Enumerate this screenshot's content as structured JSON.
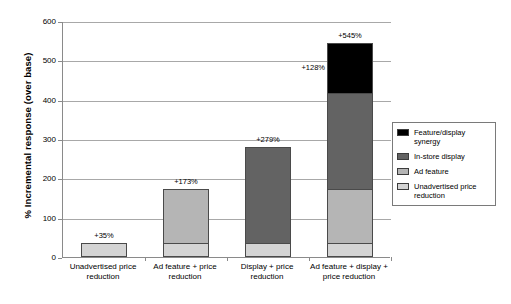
{
  "chart_data": {
    "type": "bar",
    "subtype": "stacked-bar",
    "title": "",
    "xlabel": "",
    "ylabel": "% Incremental response (over base)",
    "ylim": [
      0,
      600
    ],
    "ytick_values": [
      0,
      100,
      200,
      300,
      400,
      500,
      600
    ],
    "ytick_labels": [
      "0",
      "100",
      "200",
      "300",
      "400",
      "500",
      "600"
    ],
    "grid": true,
    "legend_position": "inside-bottom-right",
    "categories": [
      "Unadvertised price reduction",
      "Ad feature + price reduction",
      "Display + price reduction",
      "Ad feature + display + price reduction"
    ],
    "series": [
      {
        "name": "Unadvertised price reduction",
        "color": "#d4d4d4",
        "values": [
          35,
          35,
          35,
          35
        ]
      },
      {
        "name": "Ad feature",
        "color": "#b5b5b5",
        "values": [
          0,
          138,
          0,
          138
        ]
      },
      {
        "name": "In-store display",
        "color": "#636363",
        "values": [
          0,
          0,
          244,
          244
        ]
      },
      {
        "name": "Feature/display synergy",
        "color": "#000000",
        "values": [
          0,
          0,
          0,
          128
        ]
      }
    ],
    "totals": [
      35,
      173,
      279,
      545
    ],
    "total_labels": [
      "+35%",
      "+173%",
      "+279%",
      "+545%"
    ],
    "annotations": [
      {
        "text": "+128%",
        "category": "Ad feature + display + price reduction",
        "series": "Feature/display synergy"
      }
    ]
  },
  "axis": {
    "y_title": "% Incremental response (over base)",
    "ticks": [
      {
        "label": "600",
        "value": 600
      },
      {
        "label": "500",
        "value": 500
      },
      {
        "label": "400",
        "value": 400
      },
      {
        "label": "300",
        "value": 300
      },
      {
        "label": "200",
        "value": 200
      },
      {
        "label": "100",
        "value": 100
      },
      {
        "label": "0",
        "value": 0
      }
    ]
  },
  "categories": [
    {
      "line1": "Unadvertised price",
      "line2": "reduction"
    },
    {
      "line1": "Ad feature + price",
      "line2": "reduction"
    },
    {
      "line1": "Display + price",
      "line2": "reduction"
    },
    {
      "line1": "Ad feature + display +",
      "line2": "price reduction"
    }
  ],
  "bar_labels": {
    "bar1_total": "+35%",
    "bar2_total": "+173%",
    "bar3_total": "+279%",
    "bar4_total": "+545%",
    "bar4_synergy": "+128%"
  },
  "legend": {
    "items": [
      {
        "label": "Feature/display synergy",
        "color": "#000000"
      },
      {
        "label": "In-store display",
        "color": "#636363"
      },
      {
        "label": "Ad feature",
        "color": "#b5b5b5"
      },
      {
        "label": "Unadvertised price reduction",
        "color": "#d4d4d4"
      }
    ]
  }
}
